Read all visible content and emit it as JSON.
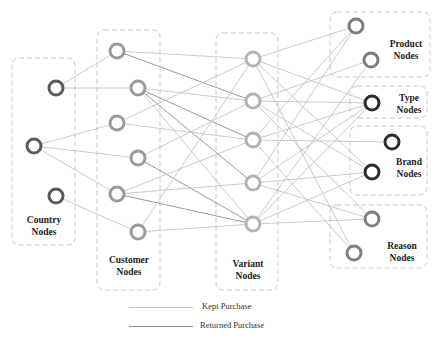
{
  "diagram": {
    "colors": {
      "country": "#5a5a5a",
      "customer": "#9a9a9a",
      "variant": "#b4b4b4",
      "product": "#7c7c7c",
      "type": "#2e2e2e",
      "brand": "#2e2e2e",
      "reason": "#808080",
      "kept_edge": "#c4c4c4",
      "returned_edge": "#8e8e8e"
    },
    "groups": [
      {
        "id": "country",
        "label_line1": "Country",
        "label_line2": "Nodes"
      },
      {
        "id": "customer",
        "label_line1": "Customer",
        "label_line2": "Nodes"
      },
      {
        "id": "variant",
        "label_line1": "Variant",
        "label_line2": "Nodes"
      },
      {
        "id": "product",
        "label_line1": "Product",
        "label_line2": "Nodes"
      },
      {
        "id": "type",
        "label_line1": "Type",
        "label_line2": "Nodes"
      },
      {
        "id": "brand",
        "label_line1": "Brand",
        "label_line2": "Nodes"
      },
      {
        "id": "reason",
        "label_line1": "Reason",
        "label_line2": "Nodes"
      }
    ],
    "nodes": [
      {
        "id": "c1",
        "group": "country",
        "x": 56,
        "y": 88
      },
      {
        "id": "c2",
        "group": "country",
        "x": 34,
        "y": 146
      },
      {
        "id": "c3",
        "group": "country",
        "x": 56,
        "y": 196
      },
      {
        "id": "u1",
        "group": "customer",
        "x": 117,
        "y": 51
      },
      {
        "id": "u2",
        "group": "customer",
        "x": 138,
        "y": 88
      },
      {
        "id": "u3",
        "group": "customer",
        "x": 117,
        "y": 123
      },
      {
        "id": "u4",
        "group": "customer",
        "x": 138,
        "y": 158
      },
      {
        "id": "u5",
        "group": "customer",
        "x": 117,
        "y": 194
      },
      {
        "id": "u6",
        "group": "customer",
        "x": 138,
        "y": 232
      },
      {
        "id": "v1",
        "group": "variant",
        "x": 253,
        "y": 59
      },
      {
        "id": "v2",
        "group": "variant",
        "x": 253,
        "y": 101
      },
      {
        "id": "v3",
        "group": "variant",
        "x": 253,
        "y": 140
      },
      {
        "id": "v4",
        "group": "variant",
        "x": 253,
        "y": 183
      },
      {
        "id": "v5",
        "group": "variant",
        "x": 253,
        "y": 224
      },
      {
        "id": "p1",
        "group": "product",
        "x": 356,
        "y": 26
      },
      {
        "id": "p2",
        "group": "product",
        "x": 371,
        "y": 60
      },
      {
        "id": "t1",
        "group": "type",
        "x": 372,
        "y": 103
      },
      {
        "id": "b1",
        "group": "brand",
        "x": 392,
        "y": 142
      },
      {
        "id": "b2",
        "group": "brand",
        "x": 372,
        "y": 172
      },
      {
        "id": "r1",
        "group": "reason",
        "x": 372,
        "y": 219
      },
      {
        "id": "r2",
        "group": "reason",
        "x": 354,
        "y": 253
      }
    ],
    "edges": [
      [
        "c1",
        "u1",
        "kept"
      ],
      [
        "c1",
        "u2",
        "kept"
      ],
      [
        "c2",
        "u3",
        "kept"
      ],
      [
        "c2",
        "u4",
        "kept"
      ],
      [
        "c2",
        "u5",
        "kept"
      ],
      [
        "c3",
        "u6",
        "kept"
      ],
      [
        "u1",
        "v1",
        "kept"
      ],
      [
        "u1",
        "v2",
        "returned"
      ],
      [
        "u2",
        "v2",
        "kept"
      ],
      [
        "u2",
        "v3",
        "returned"
      ],
      [
        "u2",
        "v4",
        "returned"
      ],
      [
        "u2",
        "v5",
        "kept"
      ],
      [
        "u3",
        "v1",
        "kept"
      ],
      [
        "u3",
        "v3",
        "kept"
      ],
      [
        "u4",
        "v2",
        "kept"
      ],
      [
        "u4",
        "v5",
        "returned"
      ],
      [
        "u5",
        "v3",
        "kept"
      ],
      [
        "u5",
        "v4",
        "kept"
      ],
      [
        "u5",
        "v5",
        "returned"
      ],
      [
        "u6",
        "v1",
        "kept"
      ],
      [
        "u6",
        "v5",
        "kept"
      ],
      [
        "v1",
        "p1",
        "kept"
      ],
      [
        "v1",
        "t1",
        "kept"
      ],
      [
        "v1",
        "b2",
        "kept"
      ],
      [
        "v1",
        "r2",
        "kept"
      ],
      [
        "v2",
        "p2",
        "kept"
      ],
      [
        "v2",
        "t1",
        "kept"
      ],
      [
        "v2",
        "b2",
        "kept"
      ],
      [
        "v2",
        "r1",
        "kept"
      ],
      [
        "v3",
        "p1",
        "kept"
      ],
      [
        "v3",
        "b1",
        "kept"
      ],
      [
        "v3",
        "t1",
        "kept"
      ],
      [
        "v3",
        "r2",
        "kept"
      ],
      [
        "v4",
        "p1",
        "kept"
      ],
      [
        "v4",
        "t1",
        "kept"
      ],
      [
        "v4",
        "b2",
        "kept"
      ],
      [
        "v4",
        "r1",
        "kept"
      ],
      [
        "v5",
        "p2",
        "kept"
      ],
      [
        "v5",
        "t1",
        "kept"
      ],
      [
        "v5",
        "b2",
        "kept"
      ],
      [
        "v5",
        "r1",
        "kept"
      ]
    ]
  },
  "legend": {
    "kept_label": "Kept Purchase",
    "returned_label": "Returned Purchase"
  }
}
